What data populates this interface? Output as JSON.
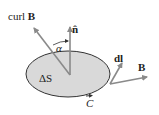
{
  "diagram": {
    "labels": {
      "curl": "curl ",
      "curl_vec": "B",
      "normal": "n̂",
      "alpha": "α",
      "area": "ΔS",
      "dl": "dl",
      "field": "B",
      "curve": "C"
    },
    "colors": {
      "surface_fill": "#d9d9d9",
      "outline": "#333333",
      "arrow": "#8a8a8a"
    }
  }
}
